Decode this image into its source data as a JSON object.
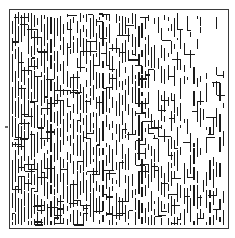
{
  "figure": {
    "kind": "abstract-line-texture",
    "alt_text": "A square bordered panel filled with thousands of short vertical black line segments joined by occasional horizontal connectors, forming a maze-like or circuit-like texture. The strokes are densest along the left edge and lower-right area and thin out toward the upper-right corner."
  },
  "canvas": {
    "width": 235,
    "height": 238,
    "background_color": "#ffffff"
  },
  "frame": {
    "name": "outer-border",
    "x": 9,
    "y": 9,
    "width": 219,
    "height": 219,
    "stroke_color": "#3a3a3a",
    "stroke_width": 1.2,
    "fill_color": "#ffffff"
  },
  "pattern": {
    "ink_color": "#1a1a1a",
    "stroke_width": 1.1,
    "column_pitch": 3.25,
    "row_pitch": 3.0,
    "inset": 3,
    "seed": 20240517,
    "vertical_segment_min": 3,
    "vertical_segment_max": 26,
    "horizontal_connector_probability": 0.17,
    "horizontal_connector_min": 3,
    "horizontal_connector_max": 11,
    "density_left": 0.93,
    "density_right": 0.34,
    "density_top": 0.88,
    "density_bottom": 0.97,
    "sparse_corner": {
      "name": "upper-right",
      "x_start_fraction": 0.72,
      "y_end_fraction": 0.44,
      "density_multiplier": 0.42
    },
    "dense_band": {
      "name": "lower-right",
      "x_start_fraction": 0.52,
      "y_start_fraction": 0.46,
      "density_multiplier": 1.22
    }
  },
  "speck": {
    "name": "scan-artifact-speck",
    "x": 5,
    "y": 126,
    "width": 3,
    "height": 2,
    "color": "#6e6e6e"
  }
}
